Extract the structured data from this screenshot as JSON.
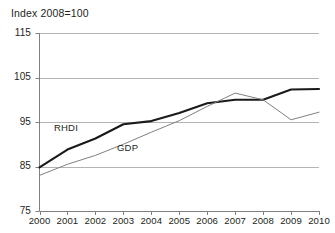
{
  "chart_data": {
    "type": "line",
    "title": "Index 2008=100",
    "xlabel": "",
    "ylabel": "",
    "x": [
      2000,
      2001,
      2002,
      2003,
      2004,
      2005,
      2006,
      2007,
      2008,
      2009,
      2010
    ],
    "xtick_labels": [
      "2000",
      "2001",
      "2002",
      "2003",
      "2004",
      "2005",
      "2006",
      "2007",
      "2008",
      "2009",
      "2010"
    ],
    "ytick_labels": [
      "75",
      "85",
      "95",
      "105",
      "115"
    ],
    "yticks": [
      75,
      85,
      95,
      105,
      115
    ],
    "ylim": [
      75,
      115
    ],
    "xlim": [
      2000,
      2010
    ],
    "grid": true,
    "grid_axis": "y",
    "legend": "inline-annotations",
    "series": [
      {
        "name": "RHDI",
        "color": "#1a1a1a",
        "width": 2.1,
        "values": [
          84.8,
          88.8,
          91.3,
          94.5,
          95.2,
          97.0,
          99.2,
          100.0,
          100.0,
          102.3,
          102.4
        ]
      },
      {
        "name": "GDP",
        "color": "#808080",
        "width": 1.0,
        "values": [
          83.0,
          85.5,
          87.5,
          90.0,
          92.7,
          95.3,
          98.5,
          101.5,
          100.0,
          95.5,
          97.2
        ]
      }
    ],
    "annotations": [
      {
        "text": "RHDI",
        "x": 2001.6,
        "y": 93.2
      },
      {
        "text": "GDP",
        "x": 2003.9,
        "y": 88.6
      }
    ]
  },
  "colors": {
    "axis": "#808080",
    "grid": "#b3b3b3",
    "text": "#231f20",
    "series_primary": "#1a1a1a",
    "series_secondary": "#808080",
    "background": "#ffffff"
  }
}
